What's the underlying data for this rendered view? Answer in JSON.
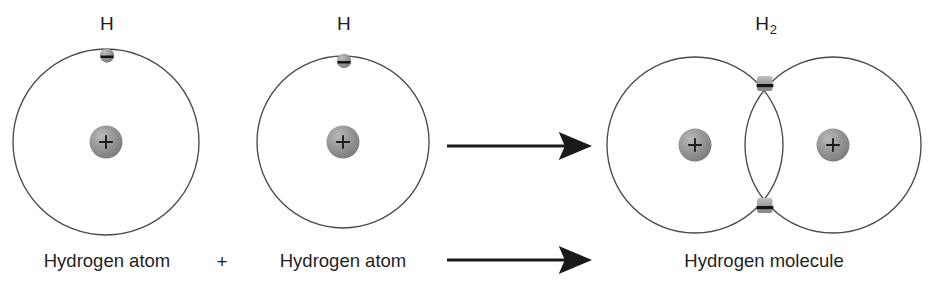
{
  "diagram": {
    "background_color": "#ffffff",
    "orbit_stroke_color": "#4a4a4a",
    "nucleus_fill_color": "#8e8e8e",
    "electron_fill_color": "#8e8e8e",
    "arrow_color": "#1a1a1a",
    "text_color": "#1f1f1f"
  },
  "left_atom": {
    "symbol": "H",
    "caption": "Hydrogen atom",
    "nucleus_charge": "+",
    "electron_charge": "–",
    "electron_count": 1
  },
  "operator": {
    "plus": "+"
  },
  "middle_atom": {
    "symbol": "H",
    "caption": "Hydrogen atom",
    "nucleus_charge": "+",
    "electron_charge": "–",
    "electron_count": 1
  },
  "arrows": {
    "upper_label": "",
    "lower_label": "",
    "direction": "right"
  },
  "molecule": {
    "symbol_main": "H",
    "symbol_sub": "2",
    "caption": "Hydrogen molecule",
    "left_nucleus_charge": "+",
    "right_nucleus_charge": "+",
    "shared_electron_top_charge": "–",
    "shared_electron_bottom_charge": "–",
    "shared_electron_count": 2
  }
}
